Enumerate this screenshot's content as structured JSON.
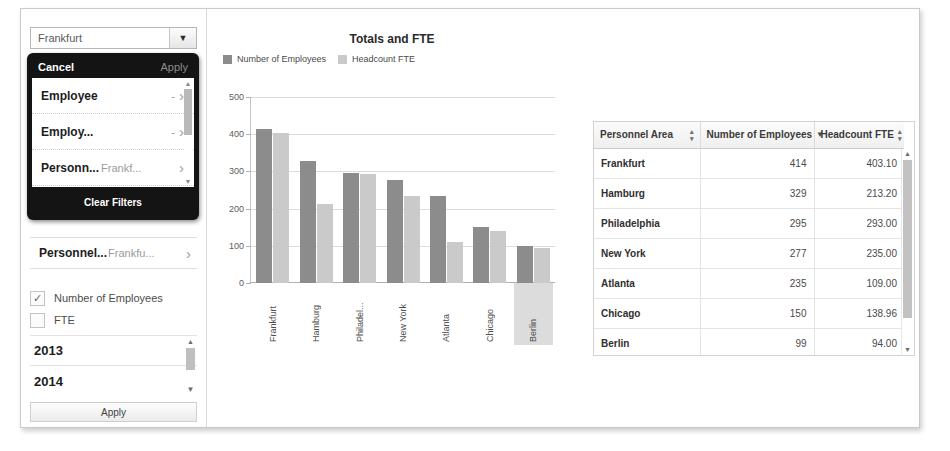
{
  "filter_panel": {
    "combo": {
      "value": "Frankfurt",
      "placeholder": "Frankfurt",
      "arrow": "▼"
    },
    "popup": {
      "cancel_label": "Cancel",
      "apply_label": "Apply",
      "clear_filters_label": "Clear Filters",
      "rows": [
        {
          "label": "Employee",
          "value": "-",
          "chevron": "›"
        },
        {
          "label": "Employ...",
          "value": "-",
          "chevron": "›"
        },
        {
          "label": "Personn...",
          "value": "Frankf...",
          "chevron": "›"
        }
      ],
      "scroll_up": "▲",
      "scroll_down": "▼"
    },
    "personnel_row": {
      "label": "Personnel...",
      "value": "Frankfu...",
      "chevron": "›"
    },
    "measures": [
      {
        "label": "Number of Employees",
        "checked": true,
        "mark": "✓"
      },
      {
        "label": "FTE",
        "checked": false,
        "mark": ""
      }
    ],
    "years": [
      {
        "label": "2013"
      },
      {
        "label": "2014"
      }
    ],
    "year_scroll_up": "▲",
    "year_scroll_down": "▼",
    "apply_button_label": "Apply"
  },
  "chart_data": {
    "type": "bar",
    "title": "Totals and FTE",
    "xlabel": "",
    "ylabel": "",
    "ylim": [
      0,
      500
    ],
    "yticks": [
      0,
      100,
      200,
      300,
      400,
      500
    ],
    "grid": true,
    "legend_position": "top-left",
    "categories": [
      "Frankfurt",
      "Hamburg",
      "Philadel...",
      "New York",
      "Atlanta",
      "Chicago",
      "Berlin"
    ],
    "selected_category": "Berlin",
    "series": [
      {
        "name": "Number of Employees",
        "color": "#8c8c8c",
        "values": [
          414,
          329,
          295,
          277,
          235,
          150,
          99
        ]
      },
      {
        "name": "Headcount FTE",
        "color": "#cacaca",
        "values": [
          403.1,
          213.2,
          293.0,
          235.0,
          109.0,
          138.96,
          94.0
        ]
      }
    ]
  },
  "table": {
    "columns": [
      {
        "label": "Personnel Area",
        "sort": "none"
      },
      {
        "label": "Number of Employees",
        "sort": "desc"
      },
      {
        "label": "Headcount FTE",
        "sort": "none"
      }
    ],
    "sort_glyph_none_up": "▴",
    "sort_glyph_none_down": "▾",
    "sort_glyph_desc": "▼",
    "rows": [
      {
        "area": "Frankfurt",
        "employees": "414",
        "fte": "403.10"
      },
      {
        "area": "Hamburg",
        "employees": "329",
        "fte": "213.20"
      },
      {
        "area": "Philadelphia",
        "employees": "295",
        "fte": "293.00"
      },
      {
        "area": "New York",
        "employees": "277",
        "fte": "235.00"
      },
      {
        "area": "Atlanta",
        "employees": "235",
        "fte": "109.00"
      },
      {
        "area": "Chicago",
        "employees": "150",
        "fte": "138.96"
      },
      {
        "area": "Berlin",
        "employees": "99",
        "fte": "94.00"
      }
    ],
    "scroll_up": "▲",
    "scroll_down": "▼"
  }
}
